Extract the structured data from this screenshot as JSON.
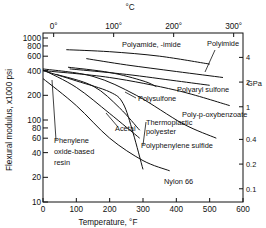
{
  "chart_data": {
    "type": "line",
    "title": "",
    "xlabel": "Temperature, °F",
    "ylabel": "Flexural modulus, x1000 psi",
    "top_axis_label": "°C",
    "right_axis_label": "GPa",
    "x_scale": "linear",
    "y_scale": "log",
    "xlim": [
      0,
      600
    ],
    "ylim": [
      10,
      1000
    ],
    "grid": false,
    "legend_position": "inline labels",
    "x_ticks": [
      "0",
      "100",
      "200",
      "300",
      "400",
      "500",
      "600"
    ],
    "y_ticks": [
      "10",
      "20",
      "40",
      "60",
      "80",
      "100",
      "200",
      "400",
      "600",
      "800",
      "1000"
    ],
    "top_ticks": [
      {
        "label": "0°",
        "f": 32
      },
      {
        "label": "100°",
        "f": 212
      },
      {
        "label": "200°",
        "f": 392
      },
      {
        "label": "300°",
        "f": 572
      }
    ],
    "right_ticks": [
      {
        "label": "4",
        "ksi": 580
      },
      {
        "label": "2",
        "ksi": 290
      },
      {
        "label": "1",
        "ksi": 145
      },
      {
        "label": "0.4",
        "ksi": 58
      },
      {
        "label": "0.2",
        "ksi": 29
      },
      {
        "label": "0.1",
        "ksi": 14.5
      }
    ],
    "series": [
      {
        "name": "Polyamide, -imide",
        "points": [
          [
            70,
            720
          ],
          [
            200,
            680
          ],
          [
            350,
            600
          ],
          [
            500,
            480
          ]
        ]
      },
      {
        "name": "Polyimide",
        "points": [
          [
            130,
            560
          ],
          [
            250,
            470
          ],
          [
            400,
            390
          ],
          [
            540,
            330
          ]
        ]
      },
      {
        "name": "Polyaryl sulfone",
        "points": [
          [
            80,
            420
          ],
          [
            250,
            360
          ],
          [
            400,
            300
          ],
          [
            500,
            265
          ]
        ]
      },
      {
        "name": "Polysulfone",
        "points": [
          [
            75,
            440
          ],
          [
            200,
            380
          ],
          [
            300,
            300
          ],
          [
            340,
            255
          ]
        ]
      },
      {
        "name": "Poly-p-oxybenzoate",
        "points": [
          [
            0,
            400
          ],
          [
            200,
            330
          ],
          [
            400,
            230
          ],
          [
            560,
            150
          ]
        ]
      },
      {
        "name": "Thermoplastic polyester",
        "points": [
          [
            40,
            360
          ],
          [
            150,
            260
          ],
          [
            230,
            140
          ],
          [
            290,
            75
          ]
        ]
      },
      {
        "name": "Polyphenylene sulfide",
        "points": [
          [
            0,
            420
          ],
          [
            150,
            340
          ],
          [
            280,
            200
          ],
          [
            420,
            90
          ],
          [
            520,
            60
          ]
        ]
      },
      {
        "name": "Acetal",
        "points": [
          [
            0,
            410
          ],
          [
            100,
            250
          ],
          [
            200,
            120
          ],
          [
            290,
            60
          ]
        ]
      },
      {
        "name": "Nylon 66",
        "points": [
          [
            0,
            320
          ],
          [
            100,
            150
          ],
          [
            200,
            60
          ],
          [
            300,
            32
          ],
          [
            380,
            24
          ]
        ]
      },
      {
        "name": "Phenylene oxide-based resin",
        "points": [
          [
            0,
            400
          ],
          [
            100,
            300
          ],
          [
            200,
            220
          ],
          [
            240,
            160
          ],
          [
            270,
            70
          ],
          [
            300,
            25
          ]
        ]
      }
    ],
    "annotations": [
      {
        "text": "Polyamide, -imide",
        "x_px": 122,
        "y_px": 47
      },
      {
        "text": "Polyimide",
        "x_px": 207,
        "y_px": 46
      },
      {
        "text": "Polyaryl sulfone",
        "x_px": 177,
        "y_px": 92
      },
      {
        "text": "Polysulfone",
        "x_px": 138,
        "y_px": 101
      },
      {
        "text": "Poly-p-oxybenzoate",
        "x_px": 182,
        "y_px": 117
      },
      {
        "text": "Acetal",
        "x_px": 115,
        "y_px": 131
      },
      {
        "text": "Thermoplastic",
        "x_px": 146,
        "y_px": 125
      },
      {
        "text": "polyester",
        "x_px": 146,
        "y_px": 134
      },
      {
        "text": "Polyphenylene sulfide",
        "x_px": 141,
        "y_px": 148
      },
      {
        "text": "Nylon 66",
        "x_px": 164,
        "y_px": 184
      },
      {
        "text": "Phenylene",
        "x_px": 54,
        "y_px": 143
      },
      {
        "text": "oxide-based",
        "x_px": 54,
        "y_px": 154
      },
      {
        "text": "resin",
        "x_px": 54,
        "y_px": 165
      }
    ]
  },
  "labels": {
    "xlabel": "Temperature,  °F",
    "ylabel": "Flexural  modulus,  x1000 psi",
    "top_unit": "°C",
    "right_unit": "GPa"
  }
}
